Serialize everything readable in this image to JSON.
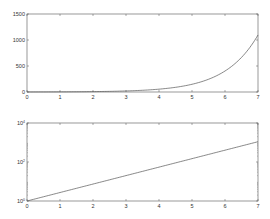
{
  "chart_data": [
    {
      "type": "line",
      "title": "",
      "xlabel": "",
      "ylabel": "",
      "function": "exp(x)",
      "yscale": "linear",
      "xlim": [
        0,
        7
      ],
      "ylim": [
        0,
        1500
      ],
      "xticks": [
        "0",
        "1",
        "2",
        "3",
        "4",
        "5",
        "6",
        "7"
      ],
      "yticks": [
        "0",
        "500",
        "1000",
        "1500"
      ],
      "grid": false,
      "legend": null,
      "series": [
        {
          "name": "exp(x)",
          "x": [
            0,
            1,
            2,
            3,
            4,
            5,
            6,
            7
          ],
          "values": [
            1,
            2.7,
            7.4,
            20.1,
            54.6,
            148.4,
            403.4,
            1096.6
          ]
        }
      ]
    },
    {
      "type": "line",
      "title": "",
      "xlabel": "",
      "ylabel": "",
      "function": "exp(x)",
      "yscale": "log",
      "xlim": [
        0,
        7
      ],
      "ylim": [
        1,
        10000
      ],
      "xticks": [
        "0",
        "1",
        "2",
        "3",
        "4",
        "5",
        "6",
        "7"
      ],
      "yticks": [
        {
          "base": "10",
          "exp": "0"
        },
        {
          "base": "10",
          "exp": "2"
        },
        {
          "base": "10",
          "exp": "4"
        }
      ],
      "grid": false,
      "legend": null,
      "series": [
        {
          "name": "exp(x)",
          "x": [
            0,
            1,
            2,
            3,
            4,
            5,
            6,
            7
          ],
          "values": [
            1,
            2.7,
            7.4,
            20.1,
            54.6,
            148.4,
            403.4,
            1096.6
          ]
        }
      ]
    }
  ],
  "style": {
    "axis_color": "#555555",
    "line_color": "#555555",
    "background": "#ffffff"
  }
}
